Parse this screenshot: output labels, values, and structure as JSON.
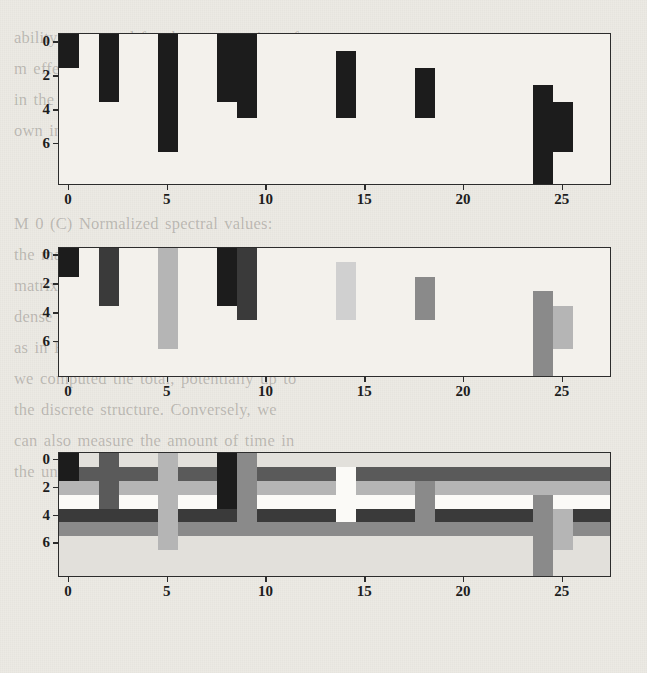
{
  "page": {
    "kind": "scanned-book-figure",
    "background_color": "#eceae4",
    "ghost_text": "ability were used for the computation of\nm effects. For comparison, we also indicate\nin the third column the time of the actual\nown in Figure 2. Later, these values were\n\n\nM 0 (C) Normalized spectral values:\nthe matrix for each column of the data\nmatrix where the mode is observed as a\ndense structure. The mapping is the same\nas in Figure 2, but it is expressed in terms\nwe computed the total, potentially up to\nthe discrete structure. Conversely, we\ncan also measure the amount of time in\nthe unified framework of the mode.\n\n\n\n\n\n\n\n\n\n\n\n\n\n\n\n"
  },
  "figure": {
    "panel_count": 3,
    "colors": {
      "frame": "#2c2c2c",
      "panel_bg": "#f3f1ec",
      "tick": "#2c2c2c",
      "tick_label": "#1d1d1d",
      "level_black": "#1c1c1c",
      "level_dark": "#3a3a3a",
      "level_mid_dark": "#5a5a5a",
      "level_mid": "#8a8a8a",
      "level_light": "#b5b5b5",
      "level_lighter": "#d0d0d0",
      "level_pale": "#e2e0db",
      "level_white": "#fbfaf7"
    },
    "axes": {
      "x_ticks": [
        0,
        5,
        10,
        15,
        20,
        25
      ],
      "x_tick_labels": [
        "0",
        "5",
        "10",
        "15",
        "20",
        "25"
      ],
      "y_ticks": [
        0,
        2,
        4,
        6
      ],
      "y_tick_labels": [
        "0",
        "2",
        "4",
        "6"
      ],
      "xlim": [
        -0.5,
        27.5
      ],
      "ylim_top_to_bottom": [
        -0.5,
        8.5
      ]
    }
  },
  "chart_data": [
    {
      "id": "panel-top",
      "type": "heatmap",
      "title": "",
      "xlabel": "",
      "ylabel": "",
      "xlim": [
        -0.5,
        27.5
      ],
      "ylim": [
        8.5,
        -0.5
      ],
      "x_ticks": [
        0,
        5,
        10,
        15,
        20,
        25
      ],
      "y_ticks": [
        0,
        2,
        4,
        6
      ],
      "grid": false,
      "legend": "none",
      "n_cols": 28,
      "n_rows": 9,
      "description": "binary occupancy pattern: filled columns only, black on white",
      "blocks": [
        {
          "col": 0,
          "row_start": 0,
          "row_end": 1,
          "level": "black"
        },
        {
          "col": 2,
          "row_start": 0,
          "row_end": 3,
          "level": "black"
        },
        {
          "col": 5,
          "row_start": 0,
          "row_end": 6,
          "level": "black"
        },
        {
          "col": 8,
          "row_start": 0,
          "row_end": 3,
          "level": "black"
        },
        {
          "col": 9,
          "row_start": 0,
          "row_end": 4,
          "level": "black"
        },
        {
          "col": 14,
          "row_start": 1,
          "row_end": 4,
          "level": "black"
        },
        {
          "col": 18,
          "row_start": 2,
          "row_end": 4,
          "level": "black"
        },
        {
          "col": 24,
          "row_start": 3,
          "row_end": 8,
          "level": "black"
        },
        {
          "col": 25,
          "row_start": 4,
          "row_end": 6,
          "level": "black"
        }
      ]
    },
    {
      "id": "panel-middle",
      "type": "heatmap",
      "title": "",
      "xlabel": "",
      "ylabel": "",
      "xlim": [
        -0.5,
        27.5
      ],
      "ylim": [
        8.5,
        -0.5
      ],
      "x_ticks": [
        0,
        5,
        10,
        15,
        20,
        25
      ],
      "y_ticks": [
        0,
        2,
        4,
        6
      ],
      "grid": false,
      "legend": "none",
      "n_cols": 28,
      "n_rows": 9,
      "description": "same support as top panel but each column shaded by its own magnitude",
      "blocks": [
        {
          "col": 0,
          "row_start": 0,
          "row_end": 1,
          "level": "black"
        },
        {
          "col": 2,
          "row_start": 0,
          "row_end": 3,
          "level": "dark"
        },
        {
          "col": 5,
          "row_start": 0,
          "row_end": 6,
          "level": "light"
        },
        {
          "col": 8,
          "row_start": 0,
          "row_end": 3,
          "level": "black"
        },
        {
          "col": 9,
          "row_start": 0,
          "row_end": 4,
          "level": "dark"
        },
        {
          "col": 14,
          "row_start": 1,
          "row_end": 4,
          "level": "lighter"
        },
        {
          "col": 18,
          "row_start": 2,
          "row_end": 4,
          "level": "mid"
        },
        {
          "col": 24,
          "row_start": 3,
          "row_end": 8,
          "level": "mid"
        },
        {
          "col": 25,
          "row_start": 4,
          "row_end": 6,
          "level": "light"
        }
      ]
    },
    {
      "id": "panel-bottom",
      "type": "heatmap",
      "title": "",
      "xlabel": "",
      "ylabel": "",
      "xlim": [
        -0.5,
        27.5
      ],
      "ylim": [
        8.5,
        -0.5
      ],
      "x_ticks": [
        0,
        5,
        10,
        15,
        20,
        25
      ],
      "y_ticks": [
        0,
        2,
        4,
        6
      ],
      "grid": false,
      "legend": "none",
      "n_cols": 28,
      "n_rows": 9,
      "description": "fully dense matrix: horizontal row bands overlaid with vertical column stripes",
      "row_bands": [
        {
          "row": 0,
          "level": "pale"
        },
        {
          "row": 1,
          "level": "mid_dark"
        },
        {
          "row": 2,
          "level": "light"
        },
        {
          "row": 3,
          "level": "white"
        },
        {
          "row": 4,
          "level": "dark"
        },
        {
          "row": 5,
          "level": "mid"
        },
        {
          "row": 6,
          "level": "pale"
        },
        {
          "row": 7,
          "level": "pale"
        },
        {
          "row": 8,
          "level": "pale"
        }
      ],
      "blocks": [
        {
          "col": 0,
          "row_start": 0,
          "row_end": 1,
          "level": "black"
        },
        {
          "col": 2,
          "row_start": 0,
          "row_end": 3,
          "level": "mid_dark"
        },
        {
          "col": 5,
          "row_start": 0,
          "row_end": 6,
          "level": "light"
        },
        {
          "col": 8,
          "row_start": 0,
          "row_end": 3,
          "level": "black"
        },
        {
          "col": 9,
          "row_start": 0,
          "row_end": 4,
          "level": "mid"
        },
        {
          "col": 14,
          "row_start": 1,
          "row_end": 4,
          "level": "white"
        },
        {
          "col": 18,
          "row_start": 2,
          "row_end": 4,
          "level": "mid"
        },
        {
          "col": 24,
          "row_start": 3,
          "row_end": 8,
          "level": "mid"
        },
        {
          "col": 25,
          "row_start": 4,
          "row_end": 6,
          "level": "light"
        }
      ]
    }
  ]
}
